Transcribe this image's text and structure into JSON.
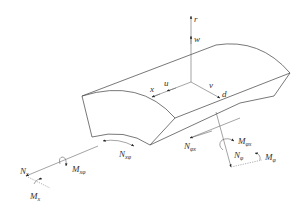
{
  "diagram": {
    "title": "",
    "axes": {
      "r": "r",
      "w": "w",
      "x": "x",
      "u": "u",
      "v": "v",
      "d": "d"
    },
    "forces": {
      "Nx": {
        "main": "N",
        "sub": "x"
      },
      "Mx": {
        "main": "M",
        "sub": "x"
      },
      "Mxphi": {
        "main": "M",
        "sub": "xφ"
      },
      "Nxphi": {
        "main": "N",
        "sub": "xφ"
      },
      "Nphix": {
        "main": "N",
        "sub": "φx"
      },
      "Mphix": {
        "main": "M",
        "sub": "φx"
      },
      "Nphi": {
        "main": "N",
        "sub": "φ"
      },
      "Mphi": {
        "main": "M",
        "sub": "φ"
      }
    },
    "colors": {
      "line": "#555555",
      "text": "#333333",
      "background": "#ffffff"
    }
  }
}
